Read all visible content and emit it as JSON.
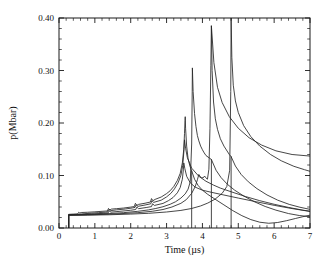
{
  "figure": {
    "name": "pressure-history-plot",
    "background": "#ffffff",
    "line_color": "#262626",
    "axis_color": "#1a1a1a"
  },
  "chart_data": {
    "type": "line",
    "title": "",
    "subtitle": "",
    "xlabel": "Time (µs)",
    "ylabel": "p(Mbar)",
    "xlim": [
      0,
      7
    ],
    "ylim": [
      0.0,
      0.4
    ],
    "xticks": [
      0,
      1,
      2,
      3,
      4,
      5,
      6,
      7
    ],
    "xtick_labels": [
      "0",
      "1",
      "2",
      "3",
      "4",
      "5",
      "6",
      "7"
    ],
    "yticks": [
      0.0,
      0.1,
      0.2,
      0.3,
      0.4
    ],
    "ytick_labels": [
      "0.00",
      "0.10",
      "0.20",
      "0.30",
      "0.40"
    ],
    "x_minor_per_major": 5,
    "y_minor_per_major": 5,
    "grid": false,
    "legend": "none",
    "annotations": [],
    "series": [
      {
        "name": "curve-1",
        "peak_time": 3.52,
        "peak_value": 0.212,
        "points": [
          [
            0.27,
            0.0
          ],
          [
            0.27,
            0.026
          ],
          [
            0.4,
            0.0265
          ],
          [
            0.52,
            0.0268
          ],
          [
            0.55,
            0.03
          ],
          [
            0.58,
            0.0285
          ],
          [
            0.62,
            0.0295
          ],
          [
            0.8,
            0.03
          ],
          [
            1.0,
            0.0308
          ],
          [
            1.2,
            0.0318
          ],
          [
            1.35,
            0.0325
          ],
          [
            1.38,
            0.0372
          ],
          [
            1.42,
            0.0345
          ],
          [
            1.46,
            0.036
          ],
          [
            1.6,
            0.0368
          ],
          [
            1.8,
            0.038
          ],
          [
            2.0,
            0.0398
          ],
          [
            2.1,
            0.0408
          ],
          [
            2.13,
            0.047
          ],
          [
            2.17,
            0.0432
          ],
          [
            2.22,
            0.045
          ],
          [
            2.4,
            0.0472
          ],
          [
            2.55,
            0.0495
          ],
          [
            2.58,
            0.056
          ],
          [
            2.62,
            0.052
          ],
          [
            2.68,
            0.0545
          ],
          [
            2.85,
            0.059
          ],
          [
            3.0,
            0.0655
          ],
          [
            3.1,
            0.071
          ],
          [
            3.2,
            0.079
          ],
          [
            3.3,
            0.0905
          ],
          [
            3.38,
            0.104
          ],
          [
            3.44,
            0.124
          ],
          [
            3.48,
            0.15
          ],
          [
            3.5,
            0.18
          ],
          [
            3.515,
            0.205
          ],
          [
            3.52,
            0.212
          ],
          [
            3.53,
            0.19
          ],
          [
            3.56,
            0.156
          ],
          [
            3.6,
            0.132
          ],
          [
            3.65,
            0.118
          ],
          [
            3.7,
            0.109
          ],
          [
            3.7,
            0.0
          ]
        ]
      },
      {
        "name": "curve-2",
        "peak_time": 3.5,
        "peak_value": 0.168,
        "points": [
          [
            0.27,
            0.0
          ],
          [
            0.27,
            0.0255
          ],
          [
            0.45,
            0.0258
          ],
          [
            0.55,
            0.0262
          ],
          [
            0.7,
            0.0272
          ],
          [
            0.9,
            0.0282
          ],
          [
            1.1,
            0.0292
          ],
          [
            1.3,
            0.0302
          ],
          [
            1.36,
            0.031
          ],
          [
            1.39,
            0.0352
          ],
          [
            1.44,
            0.033
          ],
          [
            1.6,
            0.0345
          ],
          [
            1.85,
            0.0362
          ],
          [
            2.05,
            0.0382
          ],
          [
            2.12,
            0.0392
          ],
          [
            2.15,
            0.044
          ],
          [
            2.2,
            0.0412
          ],
          [
            2.4,
            0.0438
          ],
          [
            2.56,
            0.0462
          ],
          [
            2.59,
            0.052
          ],
          [
            2.64,
            0.0488
          ],
          [
            2.85,
            0.053
          ],
          [
            3.0,
            0.0592
          ],
          [
            3.12,
            0.066
          ],
          [
            3.22,
            0.0745
          ],
          [
            3.32,
            0.086
          ],
          [
            3.4,
            0.1005
          ],
          [
            3.45,
            0.119
          ],
          [
            3.48,
            0.143
          ],
          [
            3.5,
            0.168
          ],
          [
            3.53,
            0.152
          ],
          [
            3.58,
            0.134
          ],
          [
            3.7,
            0.114
          ],
          [
            3.9,
            0.0985
          ],
          [
            4.1,
            0.089
          ],
          [
            4.25,
            0.0838
          ],
          [
            4.3,
            0.082
          ],
          [
            4.5,
            0.076
          ],
          [
            4.8,
            0.069
          ],
          [
            5.2,
            0.06
          ],
          [
            5.6,
            0.052
          ],
          [
            6.0,
            0.0452
          ],
          [
            6.4,
            0.0392
          ],
          [
            6.8,
            0.034
          ],
          [
            7.0,
            0.032
          ]
        ]
      },
      {
        "name": "curve-3",
        "peak_time": 3.48,
        "peak_value": 0.124,
        "points": [
          [
            0.27,
            0.0
          ],
          [
            0.27,
            0.025
          ],
          [
            0.5,
            0.0253
          ],
          [
            0.75,
            0.0262
          ],
          [
            1.0,
            0.027
          ],
          [
            1.25,
            0.028
          ],
          [
            1.37,
            0.0288
          ],
          [
            1.4,
            0.0325
          ],
          [
            1.45,
            0.0302
          ],
          [
            1.7,
            0.0318
          ],
          [
            2.0,
            0.0338
          ],
          [
            2.14,
            0.0352
          ],
          [
            2.17,
            0.0398
          ],
          [
            2.22,
            0.0368
          ],
          [
            2.45,
            0.0392
          ],
          [
            2.58,
            0.0408
          ],
          [
            2.61,
            0.0462
          ],
          [
            2.66,
            0.043
          ],
          [
            2.9,
            0.0468
          ],
          [
            3.05,
            0.052
          ],
          [
            3.18,
            0.058
          ],
          [
            3.3,
            0.067
          ],
          [
            3.38,
            0.077
          ],
          [
            3.44,
            0.093
          ],
          [
            3.47,
            0.112
          ],
          [
            3.48,
            0.124
          ],
          [
            3.51,
            0.113
          ],
          [
            3.56,
            0.0985
          ],
          [
            3.66,
            0.086
          ],
          [
            3.8,
            0.0778
          ],
          [
            4.0,
            0.072
          ],
          [
            4.25,
            0.068
          ],
          [
            4.6,
            0.0628
          ],
          [
            5.0,
            0.057
          ],
          [
            5.5,
            0.05
          ],
          [
            6.0,
            0.0432
          ],
          [
            6.5,
            0.037
          ],
          [
            7.0,
            0.0315
          ]
        ]
      },
      {
        "name": "curve-4",
        "peak_time": 3.72,
        "peak_value": 0.305,
        "points": [
          [
            0.27,
            0.0
          ],
          [
            0.27,
            0.0248
          ],
          [
            0.6,
            0.0252
          ],
          [
            1.0,
            0.0262
          ],
          [
            1.4,
            0.0275
          ],
          [
            1.8,
            0.0292
          ],
          [
            2.2,
            0.0318
          ],
          [
            2.5,
            0.0345
          ],
          [
            2.7,
            0.0372
          ],
          [
            2.9,
            0.0405
          ],
          [
            3.1,
            0.0452
          ],
          [
            3.25,
            0.05
          ],
          [
            3.4,
            0.057
          ],
          [
            3.52,
            0.065
          ],
          [
            3.6,
            0.074
          ],
          [
            3.66,
            0.088
          ],
          [
            3.7,
            0.16
          ],
          [
            3.715,
            0.26
          ],
          [
            3.72,
            0.305
          ],
          [
            3.74,
            0.26
          ],
          [
            3.78,
            0.218
          ],
          [
            3.82,
            0.193
          ],
          [
            3.86,
            0.176
          ],
          [
            3.9,
            0.166
          ],
          [
            3.95,
            0.156
          ],
          [
            4.0,
            0.149
          ],
          [
            4.05,
            0.143
          ],
          [
            4.1,
            0.138
          ],
          [
            4.2,
            0.133
          ],
          [
            4.25,
            0.1305
          ],
          [
            4.25,
            0.0
          ]
        ]
      },
      {
        "name": "curve-5",
        "peak_time": 4.25,
        "peak_value": 0.385,
        "points": [
          [
            0.27,
            0.0
          ],
          [
            0.27,
            0.0245
          ],
          [
            0.7,
            0.0248
          ],
          [
            1.2,
            0.0258
          ],
          [
            1.7,
            0.0272
          ],
          [
            2.2,
            0.0292
          ],
          [
            2.6,
            0.0318
          ],
          [
            2.9,
            0.0352
          ],
          [
            3.15,
            0.04
          ],
          [
            3.4,
            0.047
          ],
          [
            3.55,
            0.054
          ],
          [
            3.7,
            0.066
          ],
          [
            3.8,
            0.079
          ],
          [
            3.86,
            0.092
          ],
          [
            3.9,
            0.102
          ],
          [
            3.93,
            0.0985
          ],
          [
            3.97,
            0.096
          ],
          [
            4.02,
            0.0955
          ],
          [
            4.06,
            0.099
          ],
          [
            4.09,
            0.096
          ],
          [
            4.14,
            0.093
          ],
          [
            4.18,
            0.112
          ],
          [
            4.21,
            0.19
          ],
          [
            4.235,
            0.31
          ],
          [
            4.25,
            0.385
          ],
          [
            4.27,
            0.3
          ],
          [
            4.31,
            0.24
          ],
          [
            4.36,
            0.208
          ],
          [
            4.42,
            0.188
          ],
          [
            4.5,
            0.17
          ],
          [
            4.6,
            0.156
          ],
          [
            4.75,
            0.14
          ],
          [
            4.8,
            0.136
          ],
          [
            4.8,
            0.0
          ]
        ]
      },
      {
        "name": "curve-6",
        "peak_time": 4.8,
        "peak_value": 0.4,
        "points": [
          [
            0.27,
            0.0
          ],
          [
            0.27,
            0.0242
          ],
          [
            0.8,
            0.0245
          ],
          [
            1.4,
            0.0252
          ],
          [
            2.0,
            0.0265
          ],
          [
            2.5,
            0.028
          ],
          [
            3.0,
            0.0305
          ],
          [
            3.4,
            0.0335
          ],
          [
            3.7,
            0.0372
          ],
          [
            3.95,
            0.042
          ],
          [
            4.15,
            0.0475
          ],
          [
            4.35,
            0.0548
          ],
          [
            4.55,
            0.066
          ],
          [
            4.68,
            0.079
          ],
          [
            4.76,
            0.11
          ],
          [
            4.79,
            0.26
          ],
          [
            4.8,
            0.4
          ],
          [
            4.82,
            0.325
          ],
          [
            4.86,
            0.272
          ],
          [
            4.92,
            0.242
          ],
          [
            5.0,
            0.22
          ],
          [
            5.15,
            0.195
          ],
          [
            5.35,
            0.174
          ],
          [
            5.6,
            0.156
          ],
          [
            5.9,
            0.14
          ],
          [
            6.2,
            0.128
          ],
          [
            6.55,
            0.1175
          ],
          [
            6.85,
            0.111
          ],
          [
            7.0,
            0.108
          ]
        ]
      },
      {
        "name": "curve-7-tail-upper",
        "peak_time": 4.25,
        "peak_value": 0.385,
        "points": [
          [
            4.25,
            0.385
          ],
          [
            4.32,
            0.315
          ],
          [
            4.42,
            0.268
          ],
          [
            4.55,
            0.239
          ],
          [
            4.75,
            0.212
          ],
          [
            5.0,
            0.19
          ],
          [
            5.3,
            0.172
          ],
          [
            5.65,
            0.158
          ],
          [
            6.05,
            0.147
          ],
          [
            6.5,
            0.14
          ],
          [
            7.0,
            0.137
          ]
        ]
      },
      {
        "name": "curve-8-tail-low",
        "peak_time": 4.1,
        "peak_value": 0.1,
        "points": [
          [
            3.7,
            0.109
          ],
          [
            3.78,
            0.093
          ],
          [
            3.88,
            0.081
          ],
          [
            4.0,
            0.072
          ],
          [
            4.15,
            0.064
          ],
          [
            4.35,
            0.055
          ],
          [
            4.6,
            0.044
          ],
          [
            4.85,
            0.033
          ],
          [
            5.1,
            0.0235
          ],
          [
            5.35,
            0.016
          ],
          [
            5.6,
            0.011
          ],
          [
            5.85,
            0.009
          ],
          [
            6.1,
            0.0105
          ],
          [
            6.35,
            0.014
          ],
          [
            6.6,
            0.0182
          ],
          [
            6.8,
            0.0215
          ],
          [
            7.0,
            0.0245
          ]
        ]
      },
      {
        "name": "curve-9-tail-mid",
        "peak_time": 4.25,
        "peak_value": 0.13,
        "points": [
          [
            4.25,
            0.1305
          ],
          [
            4.38,
            0.11
          ],
          [
            4.52,
            0.096
          ],
          [
            4.7,
            0.083
          ],
          [
            4.9,
            0.072
          ],
          [
            5.15,
            0.061
          ],
          [
            5.45,
            0.05
          ],
          [
            5.75,
            0.041
          ],
          [
            6.05,
            0.034
          ],
          [
            6.4,
            0.0275
          ],
          [
            6.7,
            0.0238
          ],
          [
            7.0,
            0.0215
          ]
        ]
      },
      {
        "name": "curve-10-tail-low2",
        "peak_time": 4.8,
        "peak_value": 0.136,
        "points": [
          [
            4.8,
            0.136
          ],
          [
            4.92,
            0.118
          ],
          [
            5.08,
            0.102
          ],
          [
            5.28,
            0.088
          ],
          [
            5.52,
            0.075
          ],
          [
            5.8,
            0.063
          ],
          [
            6.1,
            0.053
          ],
          [
            6.42,
            0.045
          ],
          [
            6.72,
            0.0395
          ],
          [
            7.0,
            0.0355
          ]
        ]
      }
    ]
  }
}
